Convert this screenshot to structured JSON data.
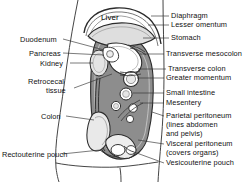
{
  "figure": {
    "colors": {
      "ink": "#1a1a1a",
      "leader_line": "#333333",
      "peritoneum_fill": "#8d8d8d",
      "organ_fill": "#d8d8d8",
      "background": "#ffffff"
    }
  },
  "organ_labels": [
    {
      "id": "liver",
      "text": "Liver",
      "x": 101,
      "y": 14
    }
  ],
  "left_labels": [
    {
      "id": "duodenum",
      "text": "Duodenum",
      "x": 20,
      "y": 36
    },
    {
      "id": "pancreas",
      "text": "Pancreas",
      "x": 29,
      "y": 50
    },
    {
      "id": "kidney",
      "text": "Kidney",
      "x": 40,
      "y": 60
    },
    {
      "id": "retrocecal",
      "text": "Retrocecal",
      "x": 28,
      "y": 78
    },
    {
      "id": "retrocecal-tissue",
      "text": "tissue",
      "x": 46,
      "y": 87
    },
    {
      "id": "colon",
      "text": "Colon",
      "x": 41,
      "y": 113
    },
    {
      "id": "rectouterine-pouch",
      "text": "Rectouterine pouch",
      "x": 2,
      "y": 151
    }
  ],
  "right_labels": [
    {
      "id": "diaphragm",
      "text": "Diaphragm",
      "x": 171,
      "y": 12
    },
    {
      "id": "lesser-omentum",
      "text": "Lesser omentum",
      "x": 171,
      "y": 21
    },
    {
      "id": "stomach",
      "text": "Stomach",
      "x": 171,
      "y": 34
    },
    {
      "id": "transverse-mesocolon",
      "text": "Transverse mesocolon",
      "x": 166,
      "y": 50
    },
    {
      "id": "transverse-colon",
      "text": "Transverse colon",
      "x": 168,
      "y": 65
    },
    {
      "id": "greater-omentum",
      "text": "Greater momentum",
      "x": 166,
      "y": 74
    },
    {
      "id": "small-intestine",
      "text": "Small intestine",
      "x": 166,
      "y": 89
    },
    {
      "id": "mesentery",
      "text": "Mesentery",
      "x": 166,
      "y": 99
    },
    {
      "id": "parietal-peritoneum",
      "text": "Parietal peritoneum",
      "x": 166,
      "y": 112
    },
    {
      "id": "parietal-note-1",
      "text": "(lines abdomen",
      "x": 166,
      "y": 121
    },
    {
      "id": "parietal-note-2",
      "text": "and pelvis)",
      "x": 166,
      "y": 130
    },
    {
      "id": "visceral-peritoneum",
      "text": "Visceral peritoneum",
      "x": 166,
      "y": 140
    },
    {
      "id": "visceral-note-1",
      "text": "(covers organs)",
      "x": 166,
      "y": 149
    },
    {
      "id": "vesicouterine-pouch",
      "text": "Vesicouterine pouch",
      "x": 166,
      "y": 159
    }
  ]
}
